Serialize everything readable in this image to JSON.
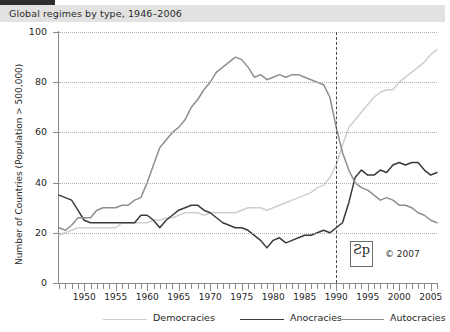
{
  "header": {
    "title": "Global regimes by type, 1946–2006"
  },
  "annotations": {
    "copyright": "© 2007",
    "logo_glyph": "Ƨp"
  },
  "chart_data": {
    "type": "line",
    "title": "Global regimes by type, 1946–2006",
    "xlabel": "",
    "ylabel": "Number of Countries (Population > 500,000)",
    "xlim": [
      1946,
      2006
    ],
    "ylim": [
      0,
      100
    ],
    "grid": true,
    "legend_position": "bottom",
    "ytick_labels": [
      "0",
      "20",
      "40",
      "60",
      "80",
      "100"
    ],
    "ytick_values": [
      0,
      20,
      40,
      60,
      80,
      100
    ],
    "xtick_labels": [
      "1950",
      "1955",
      "1960",
      "1965",
      "1970",
      "1975",
      "1980",
      "1985",
      "1990",
      "1995",
      "2000",
      "2005"
    ],
    "xtick_values": [
      1950,
      1955,
      1960,
      1965,
      1970,
      1975,
      1980,
      1985,
      1990,
      1995,
      2000,
      2005
    ],
    "x": [
      1946,
      1947,
      1948,
      1949,
      1950,
      1951,
      1952,
      1953,
      1954,
      1955,
      1956,
      1957,
      1958,
      1959,
      1960,
      1961,
      1962,
      1963,
      1964,
      1965,
      1966,
      1967,
      1968,
      1969,
      1970,
      1971,
      1972,
      1973,
      1974,
      1975,
      1976,
      1977,
      1978,
      1979,
      1980,
      1981,
      1982,
      1983,
      1984,
      1985,
      1986,
      1987,
      1988,
      1989,
      1990,
      1991,
      1992,
      1993,
      1994,
      1995,
      1996,
      1997,
      1998,
      1999,
      2000,
      2001,
      2002,
      2003,
      2004,
      2005,
      2006
    ],
    "series": [
      {
        "name": "Democracies",
        "color": "#cfcfcf",
        "values": [
          19,
          20,
          21,
          22,
          22,
          22,
          22,
          22,
          22,
          22,
          24,
          24,
          24,
          24,
          24,
          25,
          25,
          26,
          26,
          27,
          28,
          28,
          28,
          27,
          28,
          28,
          28,
          28,
          28,
          29,
          30,
          30,
          30,
          29,
          30,
          31,
          32,
          33,
          34,
          35,
          36,
          38,
          39,
          42,
          47,
          55,
          62,
          65,
          68,
          71,
          74,
          76,
          77,
          77,
          80,
          82,
          84,
          86,
          88,
          91,
          93
        ]
      },
      {
        "name": "Anocracies",
        "color": "#3a3a3a",
        "values": [
          35,
          34,
          33,
          29,
          25,
          24,
          24,
          24,
          24,
          24,
          24,
          24,
          24,
          27,
          27,
          25,
          22,
          25,
          27,
          29,
          30,
          31,
          31,
          29,
          28,
          26,
          24,
          23,
          22,
          22,
          21,
          19,
          17,
          14,
          17,
          18,
          16,
          17,
          18,
          19,
          19,
          20,
          21,
          20,
          22,
          24,
          32,
          42,
          45,
          43,
          43,
          45,
          44,
          47,
          48,
          47,
          48,
          48,
          45,
          43,
          44
        ]
      },
      {
        "name": "Autocracies",
        "color": "#8f8f8f",
        "values": [
          22,
          21,
          23,
          26,
          26,
          26,
          29,
          30,
          30,
          30,
          31,
          31,
          33,
          34,
          40,
          47,
          54,
          57,
          60,
          62,
          65,
          70,
          73,
          77,
          80,
          84,
          86,
          88,
          90,
          89,
          86,
          82,
          83,
          81,
          82,
          83,
          82,
          83,
          83,
          82,
          81,
          80,
          79,
          74,
          62,
          52,
          45,
          40,
          38,
          37,
          35,
          33,
          34,
          33,
          31,
          31,
          30,
          28,
          27,
          25,
          24
        ]
      }
    ],
    "event_marker": {
      "x": 1990,
      "style": "dashed"
    }
  }
}
